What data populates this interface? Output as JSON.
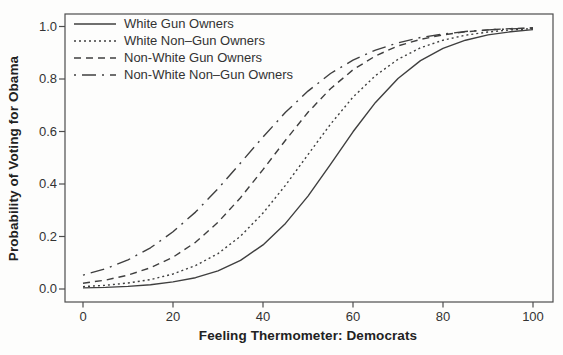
{
  "chart_data": {
    "type": "line",
    "title": "",
    "xlabel": "Feeling Thermometer: Democrats",
    "ylabel": "Probability of Voting for Obama",
    "xlim": [
      0,
      100
    ],
    "ylim": [
      0,
      1
    ],
    "x_ticks": [
      "0",
      "20",
      "40",
      "60",
      "80",
      "100"
    ],
    "x_tick_values": [
      0,
      20,
      40,
      60,
      80,
      100
    ],
    "y_ticks": [
      "0.0",
      "0.2",
      "0.4",
      "0.6",
      "0.8",
      "1.0"
    ],
    "y_tick_values": [
      0,
      0.2,
      0.4,
      0.6,
      0.8,
      1.0
    ],
    "grid": false,
    "legend_position": "top-left",
    "line_color": "#3f3f3f",
    "x": [
      0,
      5,
      10,
      15,
      20,
      25,
      30,
      35,
      40,
      45,
      50,
      55,
      60,
      65,
      70,
      75,
      80,
      85,
      90,
      95,
      100
    ],
    "series": [
      {
        "name": "White Gun Owners",
        "line_style": "solid",
        "values": [
          0.004,
          0.006,
          0.01,
          0.016,
          0.027,
          0.043,
          0.069,
          0.109,
          0.168,
          0.25,
          0.354,
          0.475,
          0.599,
          0.711,
          0.802,
          0.87,
          0.917,
          0.948,
          0.968,
          0.98,
          0.988
        ]
      },
      {
        "name": "White Non–Gun Owners",
        "line_style": "dotted",
        "values": [
          0.009,
          0.014,
          0.023,
          0.036,
          0.057,
          0.089,
          0.135,
          0.201,
          0.289,
          0.395,
          0.512,
          0.628,
          0.731,
          0.813,
          0.875,
          0.919,
          0.948,
          0.967,
          0.979,
          0.987,
          0.992
        ]
      },
      {
        "name": "Non-White Gun Owners",
        "line_style": "dashed",
        "values": [
          0.022,
          0.034,
          0.053,
          0.081,
          0.121,
          0.178,
          0.254,
          0.348,
          0.455,
          0.567,
          0.673,
          0.763,
          0.835,
          0.888,
          0.926,
          0.951,
          0.968,
          0.98,
          0.987,
          0.992,
          0.995
        ]
      },
      {
        "name": "Non-White Non–Gun Owners",
        "line_style": "dashdot",
        "values": [
          0.053,
          0.077,
          0.111,
          0.157,
          0.218,
          0.293,
          0.382,
          0.48,
          0.579,
          0.673,
          0.754,
          0.821,
          0.872,
          0.91,
          0.938,
          0.958,
          0.971,
          0.981,
          0.987,
          0.991,
          0.994
        ]
      }
    ]
  }
}
